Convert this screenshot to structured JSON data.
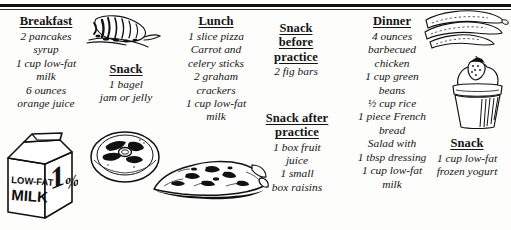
{
  "document": {
    "title": "Sample One-Day Meal Plan",
    "style": "black-and-white line-art meal plan"
  },
  "columns": {
    "breakfast": {
      "heading": "Breakfast",
      "items": [
        "2 pancakes",
        "syrup",
        "1 cup low-fat",
        "milk",
        "6 ounces",
        "orange juice"
      ]
    },
    "snack_morning": {
      "heading": "Snack",
      "items": [
        "1 bagel",
        "jam or jelly"
      ]
    },
    "lunch": {
      "heading": "Lunch",
      "items": [
        "1 slice pizza",
        "Carrot and",
        "celery sticks",
        "2 graham",
        "crackers",
        "1 cup low-fat",
        "milk"
      ]
    },
    "snack_before_practice": {
      "heading_line1": "Snack",
      "heading_line2": "before",
      "heading_line3": "practice",
      "items": [
        "2 fig bars"
      ]
    },
    "snack_after_practice": {
      "heading_line1": "Snack after",
      "heading_line2": "practice",
      "items": [
        "1 box fruit",
        "juice",
        "1 small",
        "box raisins"
      ]
    },
    "dinner": {
      "heading": "Dinner",
      "items": [
        "4 ounces",
        "barbecued",
        "chicken",
        "1 cup green",
        "beans",
        "½ cup rice",
        "1 piece French",
        "bread",
        "Salad with",
        "1 tbsp dressing",
        "1 cup low-fat",
        "milk"
      ]
    },
    "snack_evening": {
      "heading": "Snack",
      "items": [
        "1 cup low-fat",
        "frozen yogurt"
      ]
    }
  },
  "illustrations": {
    "carrot": {
      "name": "carrot-illustration",
      "label": "carrot"
    },
    "green_beans": {
      "name": "green-beans-illustration",
      "label": "green bean pods"
    },
    "frozen_yogurt": {
      "name": "frozen-yogurt-illustration",
      "label": "frozen yogurt cup with strawberry"
    },
    "milk_carton": {
      "name": "milk-carton-illustration",
      "label": "low-fat milk carton",
      "carton_text_line1": "LOW-FAT",
      "carton_text_line2": "MILK",
      "carton_percent": "1%"
    },
    "bagel_plate": {
      "name": "bagel-plate-illustration",
      "label": "bagel on plate"
    },
    "pizza_slice": {
      "name": "pizza-slice-illustration",
      "label": "slice of pizza"
    }
  },
  "colors": {
    "ink": "#141414",
    "paper": "#fdfdfc",
    "rule": "#111111"
  }
}
